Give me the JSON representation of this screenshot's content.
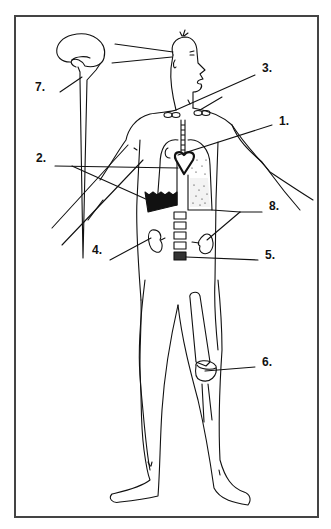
{
  "diagram": {
    "labels": [
      {
        "id": "1",
        "text": "1.",
        "x": 279,
        "y": 121
      },
      {
        "id": "2",
        "text": "2.",
        "x": 36,
        "y": 158
      },
      {
        "id": "3",
        "text": "3.",
        "x": 262,
        "y": 68
      },
      {
        "id": "4",
        "text": "4.",
        "x": 92,
        "y": 250
      },
      {
        "id": "5",
        "text": "5.",
        "x": 265,
        "y": 255
      },
      {
        "id": "6",
        "text": "6.",
        "x": 262,
        "y": 362
      },
      {
        "id": "7",
        "text": "7.",
        "x": 35,
        "y": 87
      },
      {
        "id": "8",
        "text": "8.",
        "x": 269,
        "y": 206
      }
    ],
    "colors": {
      "ink": "#111111",
      "frame": "#444444",
      "background": "#ffffff"
    }
  }
}
